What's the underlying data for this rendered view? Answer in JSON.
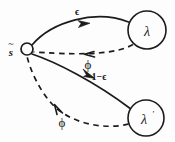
{
  "diagram": {
    "type": "state-transition-graph",
    "background_color": "#fdfdfd",
    "ink_color": "#1b1b1b",
    "nodes": [
      {
        "id": "source",
        "label": "s",
        "accent": "~",
        "shape": "small-circle",
        "cx": 27,
        "cy": 49,
        "r": 6,
        "label_x": 11,
        "label_y": 51
      },
      {
        "id": "lambda",
        "label": "λ",
        "shape": "circle",
        "cx": 147,
        "cy": 30,
        "r": 19
      },
      {
        "id": "lambda-prime",
        "label": "λ",
        "prime": "′",
        "shape": "circle",
        "cx": 146,
        "cy": 118,
        "r": 18
      }
    ],
    "edges": [
      {
        "id": "source-to-lambda",
        "from": "source",
        "to": "lambda",
        "style": "solid",
        "label": "ϵ",
        "label_x": 77,
        "label_y": 11,
        "arrow_direction": "right"
      },
      {
        "id": "lambda-to-source",
        "from": "lambda",
        "to": "source",
        "style": "dashed",
        "label": "ϕ",
        "label_x": 88,
        "label_y": 64,
        "arrow_direction": "left"
      },
      {
        "id": "source-to-lambda-prime",
        "from": "source",
        "to": "lambda-prime",
        "style": "solid",
        "label": "1−ϵ",
        "label_x": 99,
        "label_y": 76,
        "arrow_direction": "down-right"
      },
      {
        "id": "lambda-prime-to-source",
        "from": "lambda-prime",
        "to": "source",
        "style": "dashed",
        "label": "ϕ",
        "label_x": 62,
        "label_y": 122,
        "arrow_direction": "up-left"
      }
    ]
  }
}
